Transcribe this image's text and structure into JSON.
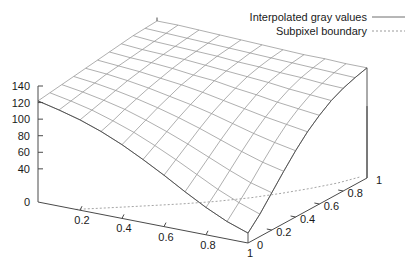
{
  "chart_data": {
    "type": "surface",
    "title": "",
    "xlabel": "",
    "ylabel": "",
    "zlabel": "",
    "projection": "3d-wireframe",
    "grid": true,
    "legend_position": "top-right",
    "xlim": [
      0,
      1
    ],
    "ylim": [
      0,
      1
    ],
    "zlim": [
      0,
      140
    ],
    "x_ticks": [
      "0",
      "0.2",
      "0.4",
      "0.6",
      "0.8",
      "1"
    ],
    "x_tick_values": [
      0,
      0.2,
      0.4,
      0.6,
      0.8,
      1
    ],
    "y_ticks": [
      "0",
      "0.2",
      "0.4",
      "0.6",
      "0.8",
      "1"
    ],
    "y_tick_values": [
      0,
      0.2,
      0.4,
      0.6,
      0.8,
      1
    ],
    "z_ticks": [
      "0",
      "40",
      "60",
      "80",
      "100",
      "120",
      "140"
    ],
    "z_tick_values": [
      0,
      40,
      60,
      80,
      100,
      120,
      140
    ],
    "series": [
      {
        "name": "Interpolated gray values",
        "style": "solid",
        "color": "#8c8c8c",
        "grid_n": 10,
        "x": [
          0,
          0.1,
          0.2,
          0.3,
          0.4,
          0.5,
          0.6,
          0.7,
          0.8,
          0.9,
          1
        ],
        "y": [
          0,
          0.1,
          0.2,
          0.3,
          0.4,
          0.5,
          0.6,
          0.7,
          0.8,
          0.9,
          1
        ],
        "z": [
          [
            122,
            124,
            126,
            128,
            130,
            132,
            134,
            136,
            138,
            139,
            140
          ],
          [
            116,
            119,
            122,
            125,
            128,
            130,
            132,
            134,
            136,
            138,
            140
          ],
          [
            109,
            113,
            117,
            121,
            125,
            128,
            131,
            133,
            135,
            137,
            139
          ],
          [
            100,
            105,
            111,
            116,
            121,
            125,
            129,
            132,
            134,
            136,
            138
          ],
          [
            89,
            96,
            103,
            110,
            116,
            122,
            126,
            130,
            133,
            135,
            137
          ],
          [
            76,
            85,
            94,
            103,
            111,
            118,
            124,
            128,
            131,
            134,
            136
          ],
          [
            62,
            73,
            84,
            95,
            105,
            113,
            120,
            126,
            130,
            133,
            135
          ],
          [
            47,
            60,
            73,
            86,
            98,
            108,
            117,
            124,
            128,
            132,
            134
          ],
          [
            33,
            47,
            62,
            77,
            91,
            103,
            113,
            121,
            127,
            131,
            134
          ],
          [
            21,
            36,
            52,
            69,
            85,
            99,
            110,
            119,
            125,
            130,
            133
          ],
          [
            12,
            27,
            45,
            63,
            80,
            95,
            107,
            117,
            124,
            129,
            133
          ]
        ]
      },
      {
        "name": "Subpixel boundary",
        "style": "dashed",
        "color": "#9a9a9a",
        "z_level": 0,
        "curve": [
          [
            0.18,
            0.0
          ],
          [
            0.25,
            0.06
          ],
          [
            0.33,
            0.13
          ],
          [
            0.42,
            0.21
          ],
          [
            0.52,
            0.3
          ],
          [
            0.62,
            0.4
          ],
          [
            0.72,
            0.52
          ],
          [
            0.8,
            0.64
          ],
          [
            0.87,
            0.76
          ],
          [
            0.93,
            0.88
          ],
          [
            0.97,
            1.0
          ]
        ]
      }
    ]
  },
  "legend": {
    "entries": [
      {
        "label": "Interpolated gray values",
        "style": "solid"
      },
      {
        "label": "Subpixel boundary",
        "style": "dashed"
      }
    ]
  },
  "axes": {
    "z_labels": [
      "140",
      "120",
      "100",
      "80",
      "60",
      "40",
      "0"
    ],
    "x_labels": [
      "0",
      "0.2",
      "0.4",
      "0.6",
      "0.8",
      "1"
    ],
    "y_labels": [
      "0",
      "0.2",
      "0.4",
      "0.6",
      "0.8",
      "1"
    ]
  }
}
